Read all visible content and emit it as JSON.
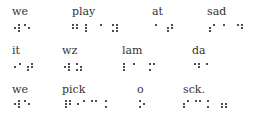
{
  "rows": [
    {
      "words": [
        {
          "text": "we",
          "x": 12,
          "y": 6
        },
        {
          "text": "play",
          "x": 72,
          "y": 6
        },
        {
          "text": "at",
          "x": 152,
          "y": 6
        },
        {
          "text": "sad",
          "x": 207,
          "y": 6
        }
      ],
      "dots": [
        [
          15,
          28
        ],
        [
          19,
          25
        ],
        [
          19,
          28
        ],
        [
          19,
          31
        ],
        [
          25,
          25
        ],
        [
          29,
          28
        ],
        [
          73,
          25
        ],
        [
          73,
          28
        ],
        [
          77,
          25
        ],
        [
          77,
          28
        ],
        [
          86,
          25
        ],
        [
          86,
          28
        ],
        [
          86,
          31
        ],
        [
          101,
          25
        ],
        [
          113,
          25
        ],
        [
          117,
          25
        ],
        [
          113,
          31
        ],
        [
          117,
          28
        ],
        [
          117,
          31
        ],
        [
          156,
          25
        ],
        [
          168,
          28
        ],
        [
          168,
          31
        ],
        [
          172,
          28
        ],
        [
          172,
          25
        ],
        [
          210,
          28
        ],
        [
          210,
          31
        ],
        [
          214,
          25
        ],
        [
          224,
          25
        ],
        [
          238,
          25
        ],
        [
          242,
          25
        ],
        [
          242,
          28
        ]
      ]
    },
    {
      "words": [
        {
          "text": "it",
          "x": 12,
          "y": 45
        },
        {
          "text": "wz",
          "x": 62,
          "y": 45
        },
        {
          "text": "lam",
          "x": 122,
          "y": 45
        },
        {
          "text": "da",
          "x": 192,
          "y": 45
        }
      ],
      "dots": [
        [
          15,
          67
        ],
        [
          20,
          64
        ],
        [
          28,
          67
        ],
        [
          28,
          70
        ],
        [
          32,
          64
        ],
        [
          32,
          67
        ],
        [
          65,
          67
        ],
        [
          69,
          64
        ],
        [
          69,
          67
        ],
        [
          69,
          70
        ],
        [
          77,
          64
        ],
        [
          77,
          70
        ],
        [
          81,
          67
        ],
        [
          81,
          70
        ],
        [
          124,
          64
        ],
        [
          124,
          67
        ],
        [
          124,
          70
        ],
        [
          134,
          64
        ],
        [
          150,
          64
        ],
        [
          154,
          64
        ],
        [
          150,
          70
        ],
        [
          195,
          64
        ],
        [
          199,
          64
        ],
        [
          199,
          67
        ],
        [
          207,
          64
        ]
      ]
    },
    {
      "words": [
        {
          "text": "we",
          "x": 12,
          "y": 84
        },
        {
          "text": "pick",
          "x": 62,
          "y": 84
        },
        {
          "text": "o",
          "x": 137,
          "y": 84
        },
        {
          "text": "sck.",
          "x": 183,
          "y": 84
        }
      ],
      "dots": [
        [
          15,
          104
        ],
        [
          19,
          101
        ],
        [
          19,
          104
        ],
        [
          19,
          107
        ],
        [
          25,
          101
        ],
        [
          29,
          104
        ],
        [
          66,
          101
        ],
        [
          66,
          104
        ],
        [
          66,
          107
        ],
        [
          70,
          101
        ],
        [
          70,
          104
        ],
        [
          78,
          104
        ],
        [
          84,
          101
        ],
        [
          92,
          101
        ],
        [
          96,
          101
        ],
        [
          106,
          101
        ],
        [
          106,
          107
        ],
        [
          140,
          101
        ],
        [
          140,
          107
        ],
        [
          144,
          104
        ],
        [
          184,
          104
        ],
        [
          184,
          107
        ],
        [
          188,
          101
        ],
        [
          196,
          101
        ],
        [
          200,
          101
        ],
        [
          208,
          101
        ],
        [
          208,
          107
        ],
        [
          222,
          104
        ],
        [
          222,
          107
        ],
        [
          226,
          104
        ],
        [
          226,
          107
        ]
      ]
    }
  ]
}
